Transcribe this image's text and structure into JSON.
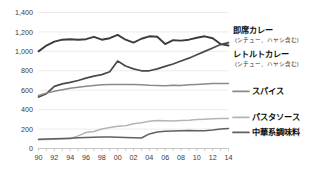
{
  "chart_data": {
    "type": "line",
    "title": "",
    "xlabel": "",
    "ylabel": "",
    "ylim": [
      0,
      1400
    ],
    "ytick_values": [
      0,
      200,
      400,
      600,
      800,
      1000,
      1200,
      1400
    ],
    "ytick_labels": [
      "0",
      "200",
      "400",
      "600",
      "800",
      "1,000",
      "1,200",
      "1,400"
    ],
    "grid": true,
    "legend_position": "right",
    "x": [
      90,
      91,
      92,
      93,
      94,
      95,
      96,
      97,
      98,
      99,
      0,
      1,
      2,
      3,
      4,
      5,
      6,
      7,
      8,
      9,
      10,
      11,
      12,
      13,
      14
    ],
    "xtick_labels": [
      "90",
      "92",
      "94",
      "96",
      "98",
      "00",
      "02",
      "04",
      "06",
      "08",
      "10",
      "12",
      "14"
    ],
    "xtick_values": [
      90,
      92,
      94,
      96,
      98,
      0,
      2,
      4,
      6,
      8,
      10,
      12,
      14
    ],
    "series": [
      {
        "name": "即席カレー",
        "sublabel": "(シチュー、ハヤシ含む)",
        "color": "#3c3c3c",
        "values": [
          1000,
          1060,
          1100,
          1120,
          1125,
          1120,
          1125,
          1150,
          1120,
          1135,
          1170,
          1120,
          1090,
          1130,
          1155,
          1150,
          1075,
          1115,
          1110,
          1120,
          1140,
          1155,
          1135,
          1075,
          1060
        ]
      },
      {
        "name": "レトルトカレー",
        "sublabel": "(シチュー、ハヤシ含む)",
        "color": "#4a4a4a",
        "values": [
          530,
          565,
          640,
          665,
          680,
          700,
          725,
          745,
          760,
          790,
          900,
          850,
          820,
          800,
          800,
          820,
          845,
          870,
          900,
          930,
          965,
          1000,
          1035,
          1070,
          1090
        ]
      },
      {
        "name": "スパイス",
        "sublabel": "",
        "color": "#8a8a8a",
        "values": [
          545,
          570,
          590,
          605,
          620,
          630,
          640,
          648,
          655,
          658,
          660,
          660,
          658,
          655,
          650,
          648,
          645,
          650,
          648,
          655,
          660,
          665,
          668,
          670,
          670
        ]
      },
      {
        "name": "パスタソース",
        "sublabel": "",
        "color": "#b4b4b4",
        "values": [
          90,
          92,
          95,
          98,
          100,
          130,
          165,
          175,
          200,
          215,
          230,
          235,
          255,
          265,
          280,
          288,
          285,
          282,
          288,
          292,
          298,
          302,
          305,
          308,
          310
        ]
      },
      {
        "name": "中華系調味料",
        "sublabel": "",
        "color": "#606060",
        "values": [
          95,
          98,
          100,
          103,
          106,
          110,
          113,
          116,
          118,
          118,
          115,
          112,
          110,
          108,
          150,
          170,
          178,
          180,
          182,
          185,
          184,
          182,
          190,
          200,
          205
        ]
      }
    ]
  }
}
